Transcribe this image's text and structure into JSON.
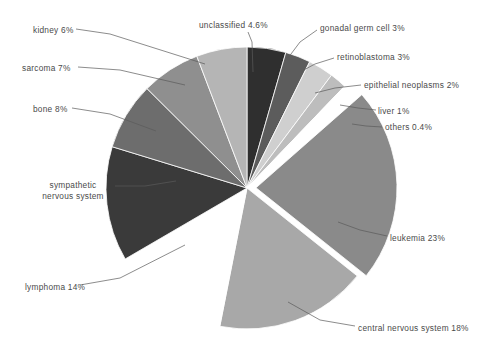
{
  "figure": {
    "width": 489,
    "height": 349,
    "background": "#ffffff",
    "label_color": "#4a4a4a"
  },
  "geometry": {
    "center_x": 247,
    "center_y": 188,
    "radius": 141,
    "start_angle_deg": -90,
    "explode_slice": "leukemia",
    "explode_offset_px": 9
  },
  "chart_data": {
    "type": "pie",
    "title": "",
    "legend_position": "callout-labels",
    "grid": false,
    "label_format": "name + percent",
    "categories": [
      "unclassified",
      "gonadal germ cell",
      "retinoblastoma",
      "epithelial neoplasms",
      "liver",
      "others",
      "leukemia",
      "central nervous system",
      "lymphoma",
      "sympathetic nervous system",
      "bone",
      "sarcoma",
      "kidney"
    ],
    "values": [
      4.6,
      3,
      3,
      2,
      1,
      0.4,
      23,
      18,
      14,
      13.6,
      8,
      7,
      6
    ],
    "value_labels": [
      "4.6%",
      "3%",
      "3%",
      "2%",
      "1%",
      "0.4%",
      "23%",
      "18%",
      "14%",
      "",
      "8%",
      "7%",
      "6%"
    ],
    "colors": [
      "#2f2f2f",
      "#5c5c5c",
      "#cfcfcf",
      "#bdbdbd",
      "#ffffff",
      "#ffffff",
      "#8a8a8a",
      "#a8a8a8",
      "#ffffff",
      "#3a3a3a",
      "#6d6d6d",
      "#8f8f8f",
      "#b5b5b5"
    ]
  },
  "labels": {
    "kidney": "kidney 6%",
    "sarcoma": "sarcoma 7%",
    "bone": "bone 8%",
    "sympathetic_line1": "sympathetic",
    "sympathetic_line2": "nervous system",
    "lymphoma": "lymphoma 14%",
    "unclassified": "unclassified 4.6%",
    "gonadal": "gonadal germ cell 3%",
    "retinoblastoma": "retinoblastoma 3%",
    "epithelial": "epithelial neoplasms 2%",
    "liver": "liver 1%",
    "others": "others 0.4%",
    "leukemia": "leukemia 23%",
    "central_nervous_system": "central nervous system 18%"
  }
}
